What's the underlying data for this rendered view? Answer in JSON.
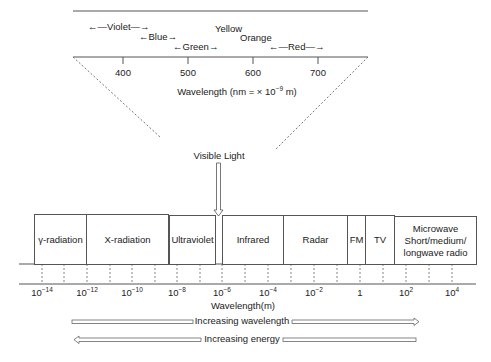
{
  "visible_spectrum": {
    "axis_label": "Wavelength (nm = × 10",
    "axis_label_exp": "−9",
    "axis_label_unit": " m)",
    "ticks": [
      {
        "value": "400"
      },
      {
        "value": "500"
      },
      {
        "value": "600"
      },
      {
        "value": "700"
      }
    ],
    "colors": [
      {
        "name": "Violet",
        "arrow_left": "←—",
        "arrow_right": "—→"
      },
      {
        "name": "Blue",
        "arrow_left": "←",
        "arrow_right": "→"
      },
      {
        "name": "Green",
        "arrow_left": "←",
        "arrow_right": "→"
      },
      {
        "name": "Yellow"
      },
      {
        "name": "Orange"
      },
      {
        "name": "Red",
        "arrow_left": "←—",
        "arrow_right": "—→"
      }
    ]
  },
  "visible_light_callout": "Visible Light",
  "bands": [
    {
      "name": "γ-radiation"
    },
    {
      "name": "X-radiation"
    },
    {
      "name": "Ultraviolet"
    },
    {
      "name": "Infrared"
    },
    {
      "name": "Radar"
    },
    {
      "name": "FM"
    },
    {
      "name": "TV"
    },
    {
      "name": "Microwave Short/medium/ longwave radio",
      "lines": [
        "Microwave",
        "Short/medium/",
        "longwave radio"
      ]
    }
  ],
  "wavelength_axis": {
    "label": "Wavelength(m)",
    "ticks": [
      {
        "base": "10",
        "exp": "−14"
      },
      {
        "base": "10",
        "exp": "−12"
      },
      {
        "base": "10",
        "exp": "−10"
      },
      {
        "base": "10",
        "exp": "−8"
      },
      {
        "base": "10",
        "exp": "−6"
      },
      {
        "base": "10",
        "exp": "−4"
      },
      {
        "base": "10",
        "exp": "−2"
      },
      {
        "base": "1",
        "exp": ""
      },
      {
        "base": "10",
        "exp": "2"
      },
      {
        "base": "10",
        "exp": "4"
      }
    ]
  },
  "arrows": {
    "increasing_wavelength": "Increasing wavelength",
    "increasing_energy": "Increasing energy"
  }
}
